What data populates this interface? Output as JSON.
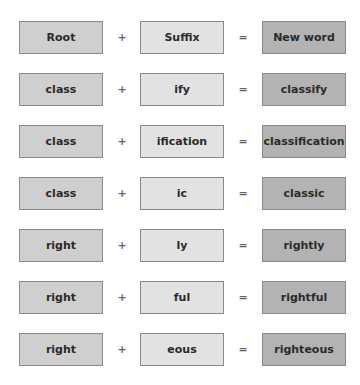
{
  "header": {
    "root": "Root",
    "plus": "+",
    "suffix": "Suffix",
    "equals": "=",
    "result": "New word"
  },
  "rows": [
    {
      "root": "class",
      "plus": "+",
      "suffix": "ify",
      "equals": "=",
      "result": "classify"
    },
    {
      "root": "class",
      "plus": "+",
      "suffix": "ification",
      "equals": "=",
      "result": "classification"
    },
    {
      "root": "class",
      "plus": "+",
      "suffix": "ic",
      "equals": "=",
      "result": "classic"
    },
    {
      "root": "right",
      "plus": "+",
      "suffix": "ly",
      "equals": "=",
      "result": "rightly"
    },
    {
      "root": "right",
      "plus": "+",
      "suffix": "ful",
      "equals": "=",
      "result": "rightful"
    },
    {
      "root": "right",
      "plus": "+",
      "suffix": "eous",
      "equals": "=",
      "result": "righteous"
    }
  ],
  "colors": {
    "root_fill": "#cfcfcf",
    "suffix_fill": "#e2e2e2",
    "result_fill": "#b3b3b3",
    "border": "#8a8a8a"
  }
}
